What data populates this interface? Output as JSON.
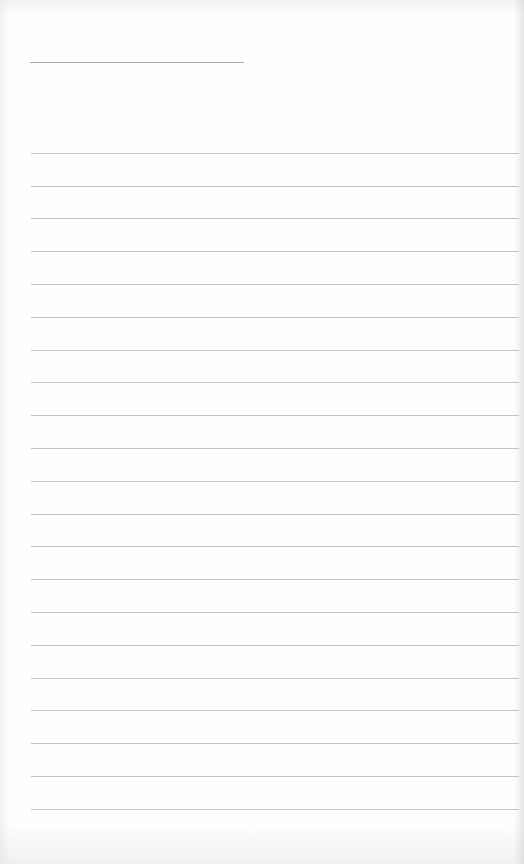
{
  "document": {
    "type": "lined-paper",
    "header_rule": {
      "present": true,
      "x": 30,
      "y": 62,
      "width": 214
    },
    "ruled_lines": {
      "count": 21,
      "first_y": 152.7,
      "spacing": 32.8,
      "x_start": 31,
      "x_end": 519
    },
    "text": "",
    "colors": {
      "paper": "#fefefe",
      "header_rule": "#a9a9a9",
      "ruled_line": "#c2c2c2"
    }
  }
}
